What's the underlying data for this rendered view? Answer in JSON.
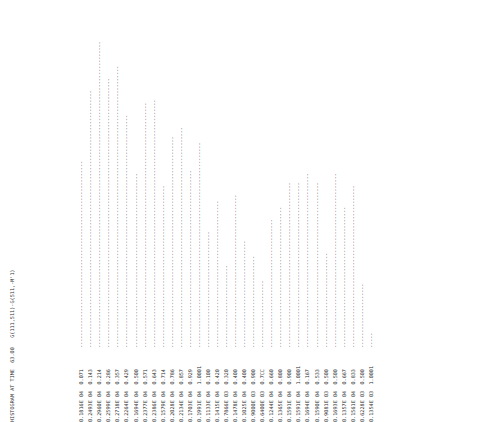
{
  "header": {
    "title_line": "HISTOGRAM AT TIME  63.00   G(111,511)-G(511,-M'1)",
    "time_label": "HISTOGRAM AT TIME",
    "time_value": "63.00",
    "variable": "G(111,511)-G(511,-M'1)"
  },
  "glyphs": {
    "bar_char": "-",
    "axis_char": "-"
  },
  "colors": {
    "ink": "#2b2b2b",
    "paper": "#ffffff"
  },
  "chart_data": {
    "type": "bar",
    "title": "HISTOGRAM AT TIME  63.00   G(111,511)-G(511,-M'1)",
    "xlabel": "",
    "ylabel": "",
    "orientation": "horizontal-printout-rotated",
    "grid": false,
    "legend": null,
    "value_column_header": "",
    "frac_column_header": "",
    "ylim": [
      0,
      1.0
    ],
    "categories": [
      "0.1816E 04",
      "0.2493E 04",
      "0.2960E 04",
      "0.2599E 04",
      "0.2718E 04",
      "0.2264E 04",
      "0.1694E 04",
      "0.2377E 04",
      "0.2386E 04",
      "0.1579E 04",
      "0.2028E 04",
      "0.2134E 04",
      "0.1703E 04",
      "0.1991E 04",
      "0.1133E 04",
      "0.1415E 04",
      "0.7866E 03",
      "0.1478E 04",
      "0.1025E 04",
      "0.9000E 03",
      "0.6400E 03",
      "0.1244E 04",
      "0.1365E 04",
      "0.1591E 04",
      "0.1591E 04",
      "0.1694E 04",
      "0.1590E 04",
      "0.9081E 03",
      "0.1693E 04",
      "0.1357E 04",
      "0.1561E 04",
      "0.6228E 03",
      "0.1354E 03"
    ],
    "fractions": [
      "0.071",
      "0.143",
      "0.214",
      "0.286",
      "0.357",
      "0.429",
      "0.500",
      "0.571",
      "0.643",
      "0.714",
      "0.786",
      "0.857",
      "0.929",
      "1.0001",
      "0.100",
      "0.420",
      "0.320",
      "0.400",
      "0.400",
      "0.900",
      "0.7CC",
      "0.660",
      "0.800",
      "0.900",
      "1.0001",
      "0.167",
      "0.533",
      "0.500",
      "0.500",
      "0.667",
      "0.833",
      "0.500",
      "1.0001"
    ],
    "values": [
      1816,
      2493,
      2960,
      2599,
      2718,
      2264,
      1694,
      2377,
      2386,
      1579,
      2028,
      2134,
      1703,
      1991,
      1133,
      1415,
      786.6,
      1478,
      1025,
      900,
      640,
      1244,
      1365,
      1591,
      1591,
      1694,
      1590,
      908.1,
      1693,
      1357,
      1561,
      622.8,
      135.4
    ],
    "bar_lengths": [
      61,
      84,
      100,
      88,
      92,
      76,
      57,
      80,
      81,
      53,
      69,
      72,
      58,
      67,
      38,
      48,
      27,
      50,
      35,
      30,
      22,
      42,
      46,
      54,
      54,
      57,
      54,
      31,
      57,
      46,
      53,
      21,
      5
    ],
    "rows": [
      {
        "value": "0.1816E 04",
        "frac": "0.071",
        "len": 61
      },
      {
        "value": "0.2493E 04",
        "frac": "0.143",
        "len": 84
      },
      {
        "value": "0.2960E 04",
        "frac": "0.214",
        "len": 100
      },
      {
        "value": "0.2599E 04",
        "frac": "0.286",
        "len": 88
      },
      {
        "value": "0.2718E 04",
        "frac": "0.357",
        "len": 92
      },
      {
        "value": "0.2264E 04",
        "frac": "0.429",
        "len": 76
      },
      {
        "value": "0.1694E 04",
        "frac": "0.500",
        "len": 57
      },
      {
        "value": "0.2377E 04",
        "frac": "0.571",
        "len": 80
      },
      {
        "value": "0.2386E 04",
        "frac": "0.643",
        "len": 81
      },
      {
        "value": "0.1579E 04",
        "frac": "0.714",
        "len": 53
      },
      {
        "value": "0.2028E 04",
        "frac": "0.786",
        "len": 69
      },
      {
        "value": "0.2134E 04",
        "frac": "0.857",
        "len": 72
      },
      {
        "value": "0.1703E 04",
        "frac": "0.929",
        "len": 58
      },
      {
        "value": "0.1991E 04",
        "frac": "1.0001",
        "len": 67
      },
      {
        "value": "0.1133E 04",
        "frac": "0.100",
        "len": 38
      },
      {
        "value": "0.1415E 04",
        "frac": "0.420",
        "len": 48
      },
      {
        "value": "0.7866E 03",
        "frac": "0.320",
        "len": 27
      },
      {
        "value": "0.1478E 04",
        "frac": "0.400",
        "len": 50
      },
      {
        "value": "0.1025E 04",
        "frac": "0.400",
        "len": 35
      },
      {
        "value": "0.9000E 03",
        "frac": "0.900",
        "len": 30
      },
      {
        "value": "0.6400E 03",
        "frac": "0.7CC",
        "len": 22
      },
      {
        "value": "0.1244E 04",
        "frac": "0.660",
        "len": 42
      },
      {
        "value": "0.1365E 04",
        "frac": "0.800",
        "len": 46
      },
      {
        "value": "0.1591E 04",
        "frac": "0.900",
        "len": 54
      },
      {
        "value": "0.1591E 04",
        "frac": "1.0001",
        "len": 54
      },
      {
        "value": "0.1694E 04",
        "frac": "0.167",
        "len": 57
      },
      {
        "value": "0.1590E 04",
        "frac": "0.533",
        "len": 54
      },
      {
        "value": "0.9081E 03",
        "frac": "0.500",
        "len": 31
      },
      {
        "value": "0.1693E 04",
        "frac": "0.500",
        "len": 57
      },
      {
        "value": "0.1357E 04",
        "frac": "0.667",
        "len": 46
      },
      {
        "value": "0.1561E 04",
        "frac": "0.833",
        "len": 53
      },
      {
        "value": "0.6228E 03",
        "frac": "0.500",
        "len": 21
      },
      {
        "value": "0.1354E 03",
        "frac": "1.0001",
        "len": 5
      }
    ]
  }
}
